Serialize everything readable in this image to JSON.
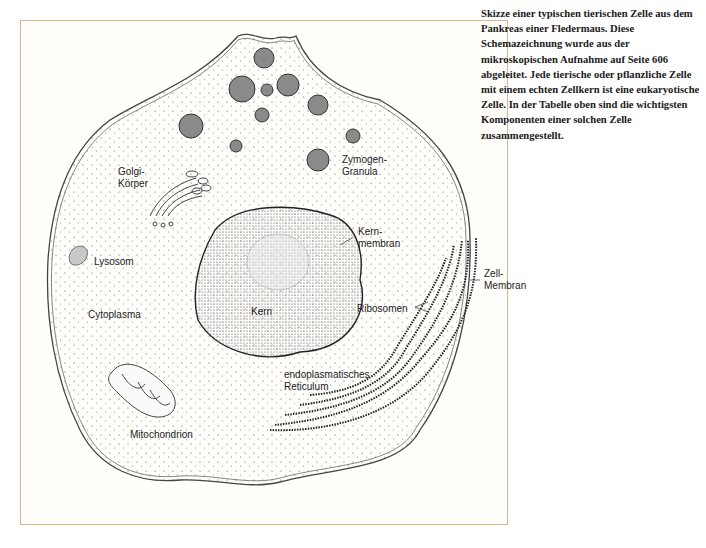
{
  "caption": {
    "text": "Skizze einer typischen tierischen Zelle aus dem Pankreas einer Fledermaus. Diese Schemazeichnung wurde aus der mikroskopischen Aufnahme auf Seite 606 abgeleitet. Jede tierische oder pflanzliche Zelle mit einem echten Zellkern ist eine eukaryotische Zelle. In der Tabelle oben sind die wichtigsten Komponenten einer solchen Zelle zusammengestellt."
  },
  "labels": {
    "golgi": "Golgi-\nKörper",
    "zymogen": "Zymogen-\nGranula",
    "lysosom": "Lysosom",
    "kernmembran": "Kern-\nmembran",
    "zellmembran": "Zell-\nMembran",
    "kern": "Kern",
    "cytoplasma": "Cytoplasma",
    "ribosomen": "Ribosomen",
    "er": "endoplasmatisches\nReticulum",
    "mitochondrion": "Mitochondrion"
  },
  "colors": {
    "frame_border": "#d8b88a",
    "granula_fill": "#8a8a8a",
    "outline": "#333333"
  }
}
